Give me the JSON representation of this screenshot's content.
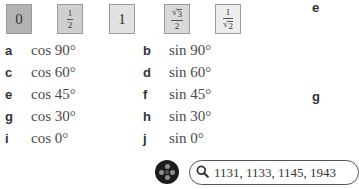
{
  "tiles": [
    {
      "id": "zero",
      "display": "0",
      "type": "integer",
      "value": "0"
    },
    {
      "id": "half",
      "display": "1/2",
      "type": "fraction",
      "numerator": "1",
      "denominator": "2"
    },
    {
      "id": "one",
      "display": "1",
      "type": "integer",
      "value": "1"
    },
    {
      "id": "root3-over-2",
      "display": "√3/2",
      "type": "fraction",
      "numerator_radical": "√",
      "numerator_radicand": "3",
      "denominator": "2"
    },
    {
      "id": "one-over-root2",
      "display": "1/√2",
      "type": "fraction",
      "numerator": "1",
      "denominator_radical": "√",
      "denominator_radicand": "2"
    }
  ],
  "items": [
    {
      "letter": "a",
      "expression": "cos 90°"
    },
    {
      "letter": "b",
      "expression": "sin 90°"
    },
    {
      "letter": "c",
      "expression": "cos 60°"
    },
    {
      "letter": "d",
      "expression": "sin 60°"
    },
    {
      "letter": "e",
      "expression": "cos 45°"
    },
    {
      "letter": "f",
      "expression": "sin 45°"
    },
    {
      "letter": "g",
      "expression": "cos 30°"
    },
    {
      "letter": "h",
      "expression": "sin 30°"
    },
    {
      "letter": "i",
      "expression": "cos 0°"
    },
    {
      "letter": "j",
      "expression": "sin 0°"
    }
  ],
  "side_labels": {
    "top": "e",
    "middle": "g"
  },
  "toolbar": {
    "app_button_icon": "app-menu-icon",
    "search_icon": "search-icon",
    "search_value": "1131, 1133, 1145, 1943"
  },
  "colors": {
    "tile_zero": "#b3b3b3",
    "tile_half": "#cfcfcf",
    "tile_one": "#e2e2e2",
    "tile_root3_over_2": "#d9d9d9",
    "tile_one_over_root2": "#ededed",
    "app_button": "#1c1c1c"
  }
}
